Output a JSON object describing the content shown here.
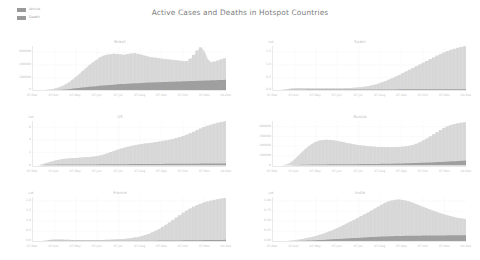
{
  "figure": {
    "title": "Active Cases and Deaths in Hotspot Countries",
    "background": "#ffffff",
    "active_color": "#dcdcdc",
    "death_color": "#9f9f9f",
    "text_color": "#bdbdbd"
  },
  "legend": {
    "position": "top-left",
    "entries": [
      {
        "label": "Active",
        "color": "#9a9a9a"
      },
      {
        "label": "Death",
        "color": "#9a9a9a"
      }
    ]
  },
  "chart_data": [
    {
      "type": "area",
      "title": "Brazil",
      "xlabel": "",
      "ylabel": "",
      "exponent": "",
      "grid": true,
      "legend": [
        "Active",
        "Death"
      ],
      "xticks": [
        "07-Mar",
        "07-Apr",
        "07-May",
        "07-Jun",
        "07-Jul",
        "07-Aug",
        "07-Sep",
        "07-Oct",
        "07-Nov",
        "04-Dec"
      ],
      "yticks": [
        "0",
        "200000",
        "400000",
        "600000"
      ],
      "ylim": [
        0,
        700000
      ],
      "series": [
        {
          "name": "Active",
          "values": [
            0,
            0,
            2000,
            5000,
            9000,
            15000,
            26000,
            40000,
            62000,
            88000,
            120000,
            160000,
            205000,
            250000,
            300000,
            350000,
            400000,
            440000,
            480000,
            520000,
            545000,
            560000,
            570000,
            578000,
            575000,
            565000,
            560000,
            572000,
            580000,
            586000,
            575000,
            560000,
            545000,
            530000,
            520000,
            515000,
            505000,
            498000,
            492000,
            485000,
            480000,
            474000,
            468000,
            462000,
            458000,
            500000,
            560000,
            630000,
            680000,
            600000,
            480000,
            440000,
            455000,
            470000,
            490000,
            505000
          ]
        },
        {
          "name": "Death",
          "values": [
            0,
            0,
            100,
            300,
            700,
            1500,
            3000,
            5500,
            9000,
            13500,
            19000,
            25000,
            31000,
            37000,
            43000,
            49000,
            55000,
            61000,
            66000,
            71000,
            76000,
            81000,
            86000,
            90000,
            94000,
            98000,
            101000,
            104000,
            107000,
            110000,
            113000,
            116000,
            119000,
            122000,
            124000,
            127000,
            129000,
            131000,
            133000,
            135000,
            137000,
            139000,
            141000,
            143000,
            145000,
            147000,
            149000,
            151000,
            153000,
            155000,
            157000,
            159000,
            161000,
            163000,
            165000,
            167000
          ]
        }
      ]
    },
    {
      "type": "area",
      "title": "Spain",
      "xlabel": "",
      "ylabel": "",
      "exponent": "1e6",
      "grid": true,
      "legend": [
        "Active",
        "Death"
      ],
      "xticks": [
        "07-Mar",
        "07-Apr",
        "07-May",
        "07-Jun",
        "07-Jul",
        "07-Aug",
        "07-Sep",
        "07-Oct",
        "07-Nov",
        "04-Dec"
      ],
      "yticks": [
        "0.0",
        "0.5",
        "1.0",
        "1.5"
      ],
      "ylim": [
        0,
        1.75
      ],
      "series": [
        {
          "name": "Active",
          "values": [
            0,
            0.0,
            0.01,
            0.03,
            0.05,
            0.07,
            0.08,
            0.09,
            0.09,
            0.09,
            0.09,
            0.08,
            0.08,
            0.08,
            0.08,
            0.08,
            0.08,
            0.08,
            0.08,
            0.08,
            0.08,
            0.09,
            0.09,
            0.1,
            0.11,
            0.12,
            0.14,
            0.16,
            0.19,
            0.22,
            0.26,
            0.31,
            0.36,
            0.42,
            0.48,
            0.54,
            0.6,
            0.67,
            0.74,
            0.81,
            0.88,
            0.95,
            1.02,
            1.09,
            1.16,
            1.23,
            1.3,
            1.37,
            1.43,
            1.49,
            1.55,
            1.6,
            1.64,
            1.68,
            1.71,
            1.74
          ]
        },
        {
          "name": "Death",
          "values": [
            0,
            0,
            0.003,
            0.008,
            0.014,
            0.02,
            0.024,
            0.026,
            0.027,
            0.027,
            0.028,
            0.028,
            0.028,
            0.028,
            0.028,
            0.028,
            0.028,
            0.029,
            0.029,
            0.029,
            0.029,
            0.029,
            0.029,
            0.029,
            0.029,
            0.03,
            0.03,
            0.03,
            0.031,
            0.031,
            0.032,
            0.033,
            0.034,
            0.035,
            0.036,
            0.037,
            0.038,
            0.039,
            0.04,
            0.041,
            0.042,
            0.043,
            0.044,
            0.045,
            0.046,
            0.046,
            0.047,
            0.047,
            0.047,
            0.047,
            0.047,
            0.047,
            0.047,
            0.047,
            0.047,
            0.047
          ]
        }
      ]
    },
    {
      "type": "area",
      "title": "US",
      "xlabel": "",
      "ylabel": "",
      "exponent": "1e6",
      "grid": true,
      "legend": [
        "Active",
        "Death"
      ],
      "xticks": [
        "07-Mar",
        "07-Apr",
        "07-May",
        "07-Jun",
        "07-Jul",
        "07-Aug",
        "07-Sep",
        "07-Oct",
        "07-Nov",
        "04-Dec"
      ],
      "yticks": [
        "0",
        "2",
        "4",
        "6"
      ],
      "ylim": [
        0,
        7
      ],
      "series": [
        {
          "name": "Active",
          "values": [
            0,
            0.02,
            0.1,
            0.25,
            0.42,
            0.58,
            0.72,
            0.85,
            0.95,
            1.02,
            1.08,
            1.12,
            1.16,
            1.2,
            1.24,
            1.28,
            1.32,
            1.38,
            1.45,
            1.55,
            1.68,
            1.85,
            2.05,
            2.25,
            2.45,
            2.62,
            2.78,
            2.92,
            3.05,
            3.16,
            3.26,
            3.35,
            3.43,
            3.5,
            3.58,
            3.66,
            3.74,
            3.83,
            3.93,
            4.04,
            4.16,
            4.3,
            4.46,
            4.64,
            4.84,
            5.06,
            5.3,
            5.56,
            5.82,
            6.05,
            6.25,
            6.42,
            6.58,
            6.72,
            6.85,
            6.95
          ]
        },
        {
          "name": "Death",
          "values": [
            0,
            0.005,
            0.02,
            0.05,
            0.08,
            0.1,
            0.11,
            0.12,
            0.13,
            0.13,
            0.14,
            0.14,
            0.14,
            0.14,
            0.15,
            0.15,
            0.15,
            0.15,
            0.15,
            0.16,
            0.16,
            0.16,
            0.17,
            0.17,
            0.18,
            0.18,
            0.19,
            0.19,
            0.2,
            0.2,
            0.2,
            0.21,
            0.21,
            0.21,
            0.22,
            0.22,
            0.22,
            0.22,
            0.23,
            0.23,
            0.23,
            0.24,
            0.24,
            0.24,
            0.25,
            0.25,
            0.26,
            0.26,
            0.27,
            0.27,
            0.28,
            0.28,
            0.28,
            0.28,
            0.28,
            0.28
          ]
        }
      ]
    },
    {
      "type": "area",
      "title": "Russia",
      "xlabel": "",
      "ylabel": "",
      "exponent": "",
      "grid": true,
      "legend": [
        "Active",
        "Death"
      ],
      "xticks": [
        "07-Mar",
        "07-Apr",
        "07-May",
        "07-Jun",
        "07-Jul",
        "07-Aug",
        "07-Sep",
        "07-Oct",
        "07-Nov",
        "04-Dec"
      ],
      "yticks": [
        "0",
        "100000",
        "200000",
        "300000",
        "400000"
      ],
      "ylim": [
        0,
        460000
      ],
      "series": [
        {
          "name": "Active",
          "values": [
            0,
            0,
            1000,
            4000,
            12000,
            30000,
            60000,
            95000,
            130000,
            165000,
            195000,
            222000,
            242000,
            255000,
            262000,
            265000,
            264000,
            260000,
            254000,
            247000,
            240000,
            232000,
            225000,
            218000,
            212000,
            207000,
            203000,
            199000,
            196000,
            193000,
            191000,
            190000,
            189000,
            188000,
            188000,
            189000,
            190000,
            193000,
            197000,
            203000,
            212000,
            224000,
            240000,
            258000,
            278000,
            300000,
            322000,
            344000,
            366000,
            388000,
            405000,
            418000,
            428000,
            436000,
            442000,
            448000
          ]
        },
        {
          "name": "Death",
          "values": [
            0,
            0,
            100,
            300,
            800,
            1600,
            2600,
            3700,
            4800,
            5800,
            6700,
            7500,
            8200,
            8800,
            9300,
            9700,
            10000,
            10300,
            10600,
            10900,
            11200,
            11500,
            11800,
            12100,
            12400,
            12700,
            13000,
            13400,
            13800,
            14200,
            14700,
            15200,
            15800,
            16500,
            17200,
            18000,
            18900,
            19800,
            20800,
            21900,
            23000,
            24200,
            25500,
            26900,
            28400,
            30000,
            31700,
            33500,
            35400,
            37400,
            39400,
            41400,
            43400,
            45400,
            47400,
            49000
          ]
        }
      ]
    },
    {
      "type": "area",
      "title": "France",
      "xlabel": "",
      "ylabel": "",
      "exponent": "1e6",
      "grid": true,
      "legend": [
        "Active",
        "Death"
      ],
      "xticks": [
        "07-Mar",
        "07-Apr",
        "07-May",
        "07-Jun",
        "07-Jul",
        "07-Aug",
        "07-Sep",
        "07-Oct",
        "07-Nov",
        "04-Dec"
      ],
      "yticks": [
        "0.0",
        "0.5",
        "1.0",
        "1.5",
        "2.0"
      ],
      "ylim": [
        0,
        2.2
      ],
      "series": [
        {
          "name": "Active",
          "values": [
            0,
            0.0,
            0.01,
            0.03,
            0.06,
            0.08,
            0.09,
            0.09,
            0.09,
            0.08,
            0.08,
            0.07,
            0.07,
            0.07,
            0.07,
            0.07,
            0.07,
            0.07,
            0.07,
            0.07,
            0.07,
            0.08,
            0.08,
            0.09,
            0.1,
            0.11,
            0.12,
            0.14,
            0.16,
            0.19,
            0.22,
            0.26,
            0.31,
            0.37,
            0.44,
            0.52,
            0.61,
            0.71,
            0.82,
            0.94,
            1.06,
            1.18,
            1.3,
            1.42,
            1.53,
            1.63,
            1.72,
            1.8,
            1.87,
            1.93,
            1.98,
            2.02,
            2.06,
            2.09,
            2.12,
            2.15
          ]
        },
        {
          "name": "Death",
          "values": [
            0,
            0.001,
            0.005,
            0.012,
            0.019,
            0.024,
            0.027,
            0.028,
            0.029,
            0.029,
            0.029,
            0.029,
            0.03,
            0.03,
            0.03,
            0.03,
            0.03,
            0.03,
            0.03,
            0.03,
            0.03,
            0.03,
            0.03,
            0.03,
            0.03,
            0.031,
            0.031,
            0.031,
            0.031,
            0.032,
            0.032,
            0.032,
            0.033,
            0.033,
            0.034,
            0.035,
            0.036,
            0.037,
            0.038,
            0.04,
            0.042,
            0.044,
            0.046,
            0.049,
            0.051,
            0.054,
            0.056,
            0.058,
            0.06,
            0.062,
            0.064,
            0.066,
            0.068,
            0.07,
            0.072,
            0.074
          ]
        }
      ]
    },
    {
      "type": "area",
      "title": "India",
      "xlabel": "",
      "ylabel": "",
      "exponent": "1e6",
      "grid": true,
      "legend": [
        "Active",
        "Death"
      ],
      "xticks": [
        "07-Mar",
        "07-Apr",
        "07-May",
        "07-Jun",
        "07-Jul",
        "07-Aug",
        "07-Sep",
        "07-Oct",
        "07-Nov",
        "04-Dec"
      ],
      "yticks": [
        "0.00",
        "0.25",
        "0.50",
        "0.75",
        "1.00"
      ],
      "ylim": [
        0,
        1.1
      ],
      "series": [
        {
          "name": "Active",
          "values": [
            0,
            0,
            0.001,
            0.004,
            0.01,
            0.018,
            0.028,
            0.04,
            0.054,
            0.07,
            0.088,
            0.108,
            0.13,
            0.155,
            0.182,
            0.212,
            0.245,
            0.28,
            0.318,
            0.358,
            0.4,
            0.442,
            0.486,
            0.53,
            0.575,
            0.62,
            0.665,
            0.712,
            0.76,
            0.81,
            0.86,
            0.91,
            0.955,
            0.99,
            1.015,
            1.03,
            1.035,
            1.028,
            1.01,
            0.985,
            0.955,
            0.92,
            0.885,
            0.85,
            0.815,
            0.782,
            0.75,
            0.72,
            0.692,
            0.665,
            0.64,
            0.618,
            0.598,
            0.58,
            0.565,
            0.552
          ]
        },
        {
          "name": "Death",
          "values": [
            0,
            0,
            0.0,
            0.001,
            0.002,
            0.004,
            0.006,
            0.009,
            0.012,
            0.015,
            0.019,
            0.023,
            0.027,
            0.031,
            0.036,
            0.041,
            0.046,
            0.051,
            0.056,
            0.061,
            0.066,
            0.071,
            0.076,
            0.081,
            0.086,
            0.091,
            0.096,
            0.101,
            0.106,
            0.11,
            0.114,
            0.118,
            0.121,
            0.124,
            0.127,
            0.13,
            0.132,
            0.134,
            0.136,
            0.137,
            0.139,
            0.14,
            0.141,
            0.142,
            0.143,
            0.144,
            0.145,
            0.146,
            0.147,
            0.148,
            0.149,
            0.15,
            0.151,
            0.152,
            0.153,
            0.154
          ]
        }
      ]
    }
  ]
}
